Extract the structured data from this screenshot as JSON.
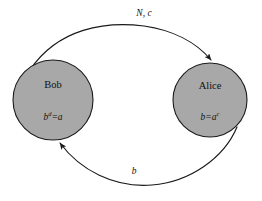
{
  "diagram": {
    "type": "communication-diagram",
    "background_color": "#ffffff",
    "stroke_color": "#1a1a1a",
    "node_fill_color": "#a8a8a8",
    "nodes": [
      {
        "id": "bob",
        "label": "Bob",
        "formula_base": "b",
        "formula_exponent": "d",
        "formula_tail": "=a",
        "formula_text": "b^d=a",
        "cx": 53,
        "cy": 100,
        "r": 40
      },
      {
        "id": "alice",
        "label": "Alice",
        "formula_base": "b=a",
        "formula_exponent": "c",
        "formula_tail": "",
        "formula_text": "b=a^c",
        "cx": 210,
        "cy": 100,
        "r": 37
      }
    ],
    "edges": [
      {
        "id": "bob-to-alice",
        "label": "N, c",
        "from": "bob",
        "to": "alice",
        "direction": "left-to-right",
        "position": "top",
        "label_x": 144,
        "label_y": 14
      },
      {
        "id": "alice-to-bob",
        "label": "b",
        "from": "alice",
        "to": "bob",
        "direction": "right-to-left",
        "position": "bottom",
        "label_x": 134,
        "label_y": 172
      }
    ]
  }
}
